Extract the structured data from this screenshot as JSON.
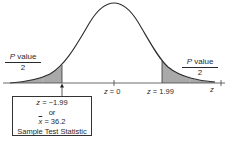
{
  "diagram": {
    "type": "two-tailed normal distribution (standard normal curve)",
    "colors": {
      "curve": "#2b2b2b",
      "shade": "#a9a9a9",
      "axis": "#444444",
      "text": "#2a2a2a"
    },
    "tails": {
      "left": {
        "numerator": "P value",
        "numerator_italic": "P",
        "numerator_rest": " value",
        "denominator": "2"
      },
      "right": {
        "numerator": "P value",
        "numerator_italic": "P",
        "numerator_rest": " value",
        "denominator": "2"
      }
    },
    "axis": {
      "variable_label": "z",
      "ticks": [
        {
          "label_var": "z",
          "label_rest": " = 0",
          "value": 0
        },
        {
          "label_var": "z",
          "label_rest": " = 1.99",
          "value": 1.99
        }
      ]
    },
    "callout": {
      "line1_var": "z",
      "line1_rest": " = −1.99",
      "line2": "or",
      "line3_var": "x",
      "line3_rest": " = 36.2",
      "line4": "Sample Test Statistic"
    }
  }
}
